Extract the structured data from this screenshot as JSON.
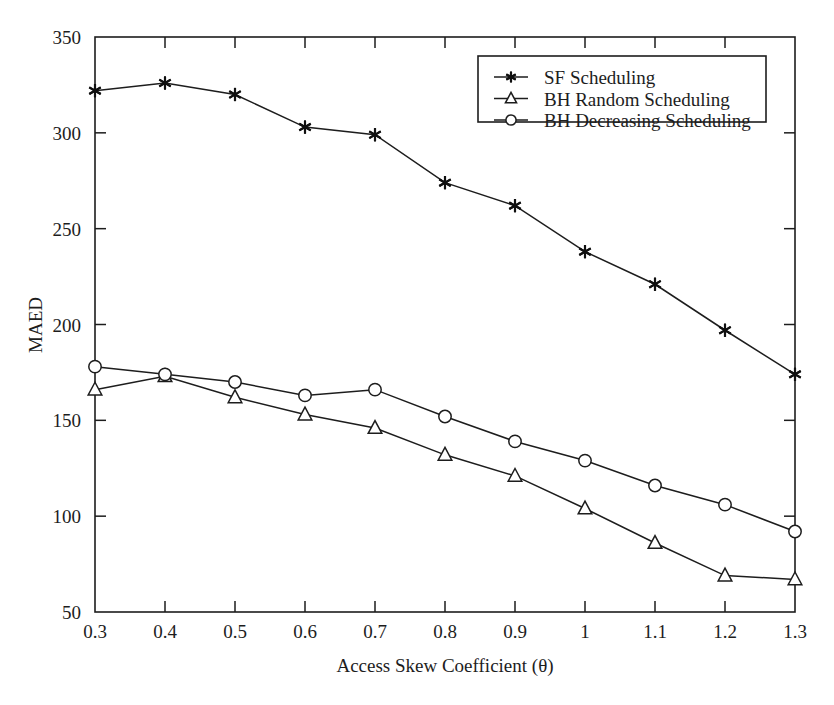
{
  "chart_data": {
    "type": "line",
    "title": "",
    "xlabel": "Access Skew Coefficient (θ)",
    "ylabel": "MAED",
    "x": [
      0.3,
      0.4,
      0.5,
      0.6,
      0.7,
      0.8,
      0.9,
      1.0,
      1.1,
      1.2,
      1.3
    ],
    "xticklabels": [
      "0.3",
      "0.4",
      "0.5",
      "0.6",
      "0.7",
      "0.8",
      "0.9",
      "1",
      "1.1",
      "1.2",
      "1.3"
    ],
    "yticklabels": [
      "50",
      "100",
      "150",
      "200",
      "250",
      "300",
      "350"
    ],
    "yticks": [
      50,
      100,
      150,
      200,
      250,
      300,
      350
    ],
    "xlim": [
      0.3,
      1.3
    ],
    "ylim": [
      50,
      350
    ],
    "grid": false,
    "legend_position": "top-right",
    "series": [
      {
        "name": "SF Scheduling",
        "marker": "star",
        "values": [
          322,
          326,
          320,
          303,
          299,
          274,
          262,
          238,
          221,
          197,
          174
        ]
      },
      {
        "name": "BH Random Scheduling",
        "marker": "triangle",
        "values": [
          166,
          173,
          162,
          153,
          146,
          132,
          121,
          104,
          86,
          69,
          67
        ]
      },
      {
        "name": "BH Decreasing Scheduling",
        "marker": "circle",
        "values": [
          178,
          174,
          170,
          163,
          166,
          152,
          139,
          129,
          116,
          106,
          92
        ]
      }
    ]
  },
  "legend": {
    "items": [
      {
        "label": "SF Scheduling",
        "marker": "star-marker-icon"
      },
      {
        "label": "BH Random Scheduling",
        "marker": "triangle-marker-icon"
      },
      {
        "label": "BH Decreasing Scheduling",
        "marker": "circle-marker-icon"
      }
    ]
  },
  "colors": {
    "ink": "#1d1d1d",
    "background": "#ffffff"
  }
}
